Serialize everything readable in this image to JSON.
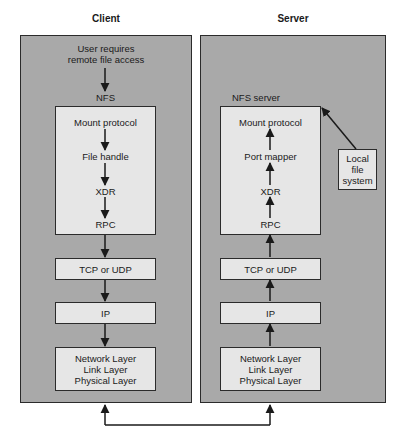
{
  "client": {
    "title": "Client",
    "user_text_line1": "User requires",
    "user_text_line2": "remote file access",
    "nfs_label": "NFS",
    "nfs_stack": [
      "Mount protocol",
      "File handle",
      "XDR",
      "RPC"
    ],
    "transport": "TCP or UDP",
    "network": "IP",
    "lower_layers": [
      "Network Layer",
      "Link Layer",
      "Physical Layer"
    ]
  },
  "server": {
    "title": "Server",
    "nfs_label": "NFS server",
    "nfs_stack": [
      "Mount protocol",
      "Port mapper",
      "XDR",
      "RPC"
    ],
    "transport": "TCP or UDP",
    "network": "IP",
    "lower_layers": [
      "Network Layer",
      "Link Layer",
      "Physical Layer"
    ],
    "local_fs": [
      "Local",
      "file",
      "system"
    ]
  },
  "colors": {
    "panel": "#a9a9a9",
    "box": "#e6e6e6",
    "line": "#1a1a1a"
  }
}
